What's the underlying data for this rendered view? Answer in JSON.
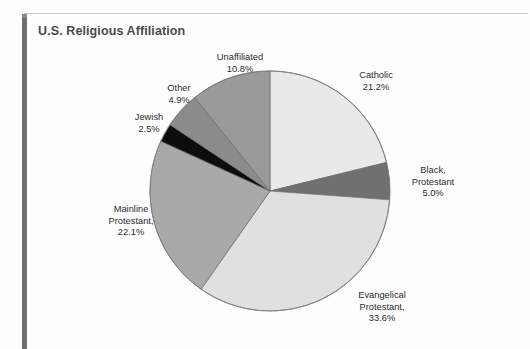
{
  "figure": {
    "title": "U.S. Religious Affiliation",
    "accent_spine_color": "#6f6f6f",
    "rule_color": "#c9c9c9",
    "title_color": "#4a4a4a"
  },
  "chart_data": {
    "type": "pie",
    "title": "U.S. Religious Affiliation",
    "xlabel": "",
    "ylabel": "",
    "legend_position": "none",
    "labels_outside": true,
    "start_angle_deg": 0,
    "direction": "clockwise",
    "categories": [
      "Catholic",
      "Black, Protestant",
      "Evangelical Protestant,",
      "Mainline Protestant,",
      "Jewish",
      "Other",
      "Unaffiliated"
    ],
    "values": [
      21.2,
      5.0,
      33.6,
      22.1,
      2.5,
      4.9,
      10.8
    ],
    "value_labels": [
      "21.2%",
      "5.0%",
      "33.6%",
      "22.1%",
      "2.5%",
      "4.9%",
      "10.8%"
    ],
    "colors": [
      "#e9e9e9",
      "#707070",
      "#e0e0e0",
      "#a9a9a9",
      "#0d0d0d",
      "#8b8b8b",
      "#9a9a9a"
    ],
    "slices": [
      {
        "name": "Catholic",
        "value": 21.2,
        "label": "Catholic",
        "value_label": "21.2%",
        "color": "#e9e9e9"
      },
      {
        "name": "Black, Protestant",
        "value": 5.0,
        "label": "Black,",
        "label2": "Protestant",
        "value_label": "5.0%",
        "color": "#707070"
      },
      {
        "name": "Evangelical Protestant",
        "value": 33.6,
        "label": "Evangelical",
        "label2": "Protestant,",
        "value_label": "33.6%",
        "color": "#e0e0e0"
      },
      {
        "name": "Mainline Protestant",
        "value": 22.1,
        "label": "Mainline",
        "label2": "Protestant,",
        "value_label": "22.1%",
        "color": "#a9a9a9"
      },
      {
        "name": "Jewish",
        "value": 2.5,
        "label": "Jewish",
        "value_label": "2.5%",
        "color": "#0d0d0d"
      },
      {
        "name": "Other",
        "value": 4.9,
        "label": "Other",
        "value_label": "4.9%",
        "color": "#8b8b8b"
      },
      {
        "name": "Unaffiliated",
        "value": 10.8,
        "label": "Unaffiliated",
        "value_label": "10.8%",
        "color": "#9a9a9a"
      }
    ],
    "total": 100.1
  },
  "labels": {
    "unaffiliated": {
      "l1": "Unaffiliated",
      "l2": "10.8%"
    },
    "other": {
      "l1": "Other",
      "l2": "4.9%"
    },
    "jewish": {
      "l1": "Jewish",
      "l2": "2.5%"
    },
    "catholic": {
      "l1": "Catholic",
      "l2": "21.2%"
    },
    "black": {
      "l1": "Black,",
      "l2": "Protestant",
      "l3": "5.0%"
    },
    "mainline": {
      "l1": "Mainline",
      "l2": "Protestant,",
      "l3": "22.1%"
    },
    "evangelical": {
      "l1": "Evangelical",
      "l2": "Protestant,",
      "l3": "33.6%"
    }
  }
}
